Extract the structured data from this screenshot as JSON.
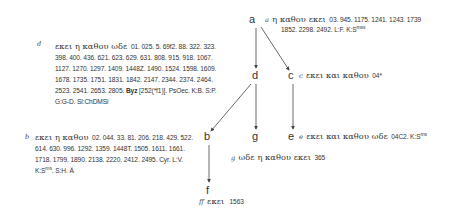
{
  "nodes": {
    "a": "a",
    "b": "b",
    "c": "c",
    "d": "d",
    "e": "e",
    "f": "f",
    "g": "g"
  },
  "readings": {
    "a": {
      "label": "a",
      "greek": "η καθου εκει",
      "line1": "03. 945. 1175. 1241. 1243. 1739",
      "line2": "1852. 2298. 2492. L:F. K:S",
      "sup": "mss"
    },
    "c": {
      "label": "c",
      "greek": "εκει και καθου",
      "wits": "04*"
    },
    "d": {
      "label": "d",
      "greek": "εκει η καθου ωδε",
      "line1": "01. 025. 5. 69f2. 88. 322. 323.",
      "line2": "398. 400. 436. 621. 623. 629. 631. 808. 915. 918. 1067.",
      "line3": "1127. 1270. 1297. 1409. 1448Z. 1490. 1524. 1598. 1609.",
      "line4": "1678. 1735. 1751. 1831. 1842. 2147. 2344. 2374. 2464.",
      "line5_pre": "2523. 2541. 2653. 2805.",
      "line5_bold": "Byz",
      "line5_post": "[252(*f1)]. PsOec. K:B. S:P.",
      "line6": "G:G-D. Sl:ChDMSi"
    },
    "b": {
      "label": "b",
      "greek": "εκει η καθου",
      "line1": "02. 044. 33. 81. 206. 218. 429. 522.",
      "line2": "614. 630. 996. 1292. 1359. 1448T. 1505. 1611. 1661.",
      "line3": "1718. 1799. 1890. 2138. 2220. 2412. 2495. Cyr. L:V.",
      "line4_pre": "K:S",
      "line4_sup": "ms",
      "line4_post": ". S:H. Ä"
    },
    "e": {
      "label": "e",
      "greek": "εκει και καθου ωδε",
      "wits_pre": "04C2. K:S",
      "sup": "ms"
    },
    "g": {
      "label": "g",
      "greek": "ωδε η καθου εκει",
      "wits": "365"
    },
    "f": {
      "label": "ff",
      "greek": "εκει",
      "wits": "1563"
    }
  },
  "colors": {
    "text": "#333333",
    "lines": "#444444",
    "background": "#ffffff"
  }
}
